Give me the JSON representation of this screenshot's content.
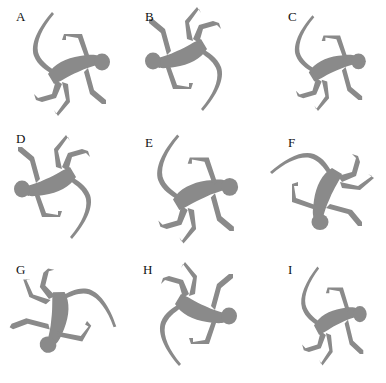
{
  "figure": {
    "silhouette_color": "#8a8a8a",
    "panels": [
      {
        "label": "A",
        "pose": "tail-up-left, head-right, arm-raised"
      },
      {
        "label": "B",
        "pose": "head-left, tail-down-right, limbs-up"
      },
      {
        "label": "C",
        "pose": "tail-up-left, head-right, arm-raised"
      },
      {
        "label": "D",
        "pose": "head-left, tail-down-right, limbs-up"
      },
      {
        "label": "E",
        "pose": "tail-up-left, head-right, arm-raised"
      },
      {
        "label": "F",
        "pose": "head-top, tail-sweep-left, limbs-right"
      },
      {
        "label": "G",
        "pose": "head-bottom, tail-up-right, inverted"
      },
      {
        "label": "H",
        "pose": "head-right, tail-down-left, limbs-up"
      },
      {
        "label": "I",
        "pose": "tail-up, head-right, arm-raised, narrow"
      }
    ]
  }
}
